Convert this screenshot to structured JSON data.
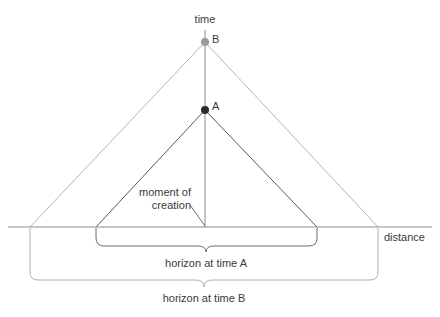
{
  "figure": {
    "background_color": "#ffffff",
    "axes": {
      "time_axis": {
        "label": "time",
        "orientation": "vertical",
        "color": "#8c8c8c",
        "x": 205,
        "y_top": 30,
        "y_bottom": 227
      },
      "distance_axis": {
        "label": "distance",
        "orientation": "horizontal",
        "color": "#8c8c8c",
        "y": 227,
        "x_left": 8,
        "x_right": 432
      }
    },
    "points": [
      {
        "id": "B",
        "label": "B",
        "x": 205,
        "y": 42,
        "color": "#9a9a9a",
        "radius": 4
      },
      {
        "id": "A",
        "label": "A",
        "x": 205,
        "y": 110,
        "color": "#2a2a2a",
        "radius": 4
      }
    ],
    "cones": [
      {
        "id": "cone-B",
        "apex": "B",
        "color": "#b5b5b5",
        "apex_x": 205,
        "apex_y": 42,
        "base_left_x": 30,
        "base_right_x": 378,
        "base_y": 227
      },
      {
        "id": "cone-A",
        "apex": "A",
        "color": "#585858",
        "apex_x": 205,
        "apex_y": 110,
        "base_left_x": 96,
        "base_right_x": 317,
        "base_y": 227
      }
    ],
    "annotations": [
      {
        "id": "moment-of-creation",
        "line1": "moment of",
        "line2": "creation",
        "text_x": 131,
        "text_y": 188,
        "leader_from_x": 190,
        "leader_from_y": 205,
        "leader_to_x": 205,
        "leader_to_y": 226,
        "color": "#3a3a3a"
      }
    ],
    "braces": [
      {
        "id": "horizon-at-time-A",
        "label": "horizon at time A",
        "color": "#6b6b6b",
        "left_x": 96,
        "right_x": 317,
        "top_y": 228,
        "bottom_y": 250,
        "label_x": 206,
        "label_y": 258
      },
      {
        "id": "horizon-at-time-B",
        "label": "horizon at time B",
        "color": "#b0b0b0",
        "left_x": 30,
        "right_x": 378,
        "top_y": 228,
        "bottom_y": 285,
        "label_x": 204,
        "label_y": 293
      }
    ]
  }
}
